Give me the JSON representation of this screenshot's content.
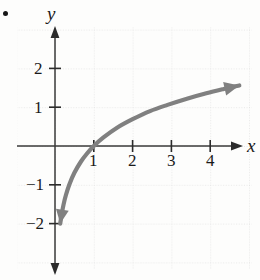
{
  "figure": {
    "kind": "cartesian-graph",
    "bullet_marker": "•",
    "axes": {
      "x_label": "x",
      "y_label": "y",
      "x_ticks": [
        "1",
        "2",
        "3",
        "4"
      ],
      "y_ticks": [
        "2",
        "1",
        "−1",
        "−2"
      ]
    },
    "colors": {
      "curve": "#808080",
      "axis": "#2b2b2b",
      "grid": "#c9c9c9",
      "text": "#1a1a1a",
      "background": "#fdfdfc"
    }
  },
  "chart_data": {
    "type": "line",
    "title": "",
    "xlabel": "x",
    "ylabel": "y",
    "xlim": [
      -0.95,
      5.2
    ],
    "ylim": [
      -3.0,
      2.85
    ],
    "grid": true,
    "legend": null,
    "x_ticks": [
      1,
      2,
      3,
      4
    ],
    "y_ticks": [
      2,
      1,
      -1,
      -2
    ],
    "x_tick_labels": [
      "1",
      "2",
      "3",
      "4"
    ],
    "y_tick_labels": [
      "2",
      "1",
      "−1",
      "−2"
    ],
    "series": [
      {
        "name": "y = ln x",
        "color": "#808080",
        "arrow_start": true,
        "arrow_end": true,
        "x": [
          0.135,
          0.17,
          0.22,
          0.28,
          0.37,
          0.5,
          0.67,
          0.82,
          1.0,
          1.25,
          1.6,
          2.0,
          2.45,
          2.9,
          3.4,
          3.9,
          4.35,
          4.75
        ],
        "y": [
          -2.0,
          -1.77,
          -1.51,
          -1.27,
          -0.99,
          -0.69,
          -0.4,
          -0.2,
          0.0,
          0.22,
          0.47,
          0.69,
          0.9,
          1.06,
          1.22,
          1.36,
          1.47,
          1.56
        ]
      }
    ],
    "annotations": [
      {
        "text": "•",
        "x_px": 5,
        "y_px": 13,
        "kind": "bullet-marker"
      }
    ]
  }
}
